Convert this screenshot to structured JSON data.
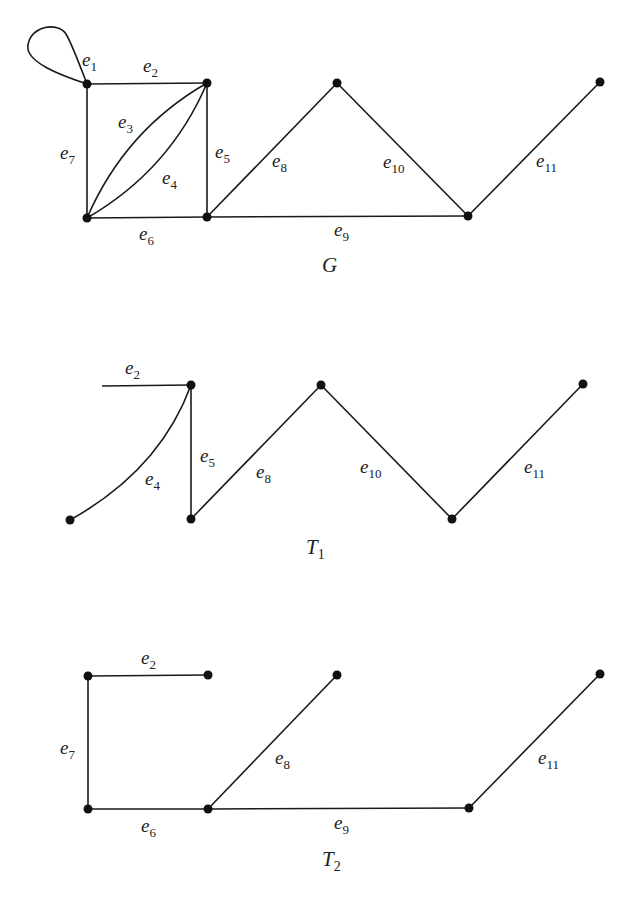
{
  "graphs": {
    "G": {
      "title": "G",
      "title_sub": "",
      "edges": {
        "e1": {
          "name": "e",
          "sub": "1"
        },
        "e2": {
          "name": "e",
          "sub": "2"
        },
        "e3": {
          "name": "e",
          "sub": "3"
        },
        "e4": {
          "name": "e",
          "sub": "4"
        },
        "e5": {
          "name": "e",
          "sub": "5"
        },
        "e6": {
          "name": "e",
          "sub": "6"
        },
        "e7": {
          "name": "e",
          "sub": "7"
        },
        "e8": {
          "name": "e",
          "sub": "8"
        },
        "e9": {
          "name": "e",
          "sub": "9"
        },
        "e10": {
          "name": "e",
          "sub": "10"
        },
        "e11": {
          "name": "e",
          "sub": "11"
        }
      },
      "vertex_count": 7,
      "edge_count": 11
    },
    "T1": {
      "title": "T",
      "title_sub": "1",
      "edges": {
        "e2": {
          "name": "e",
          "sub": "2"
        },
        "e4": {
          "name": "e",
          "sub": "4"
        },
        "e5": {
          "name": "e",
          "sub": "5"
        },
        "e8": {
          "name": "e",
          "sub": "8"
        },
        "e10": {
          "name": "e",
          "sub": "10"
        },
        "e11": {
          "name": "e",
          "sub": "11"
        }
      }
    },
    "T2": {
      "title": "T",
      "title_sub": "2",
      "edges": {
        "e2": {
          "name": "e",
          "sub": "2"
        },
        "e6": {
          "name": "e",
          "sub": "6"
        },
        "e7": {
          "name": "e",
          "sub": "7"
        },
        "e8": {
          "name": "e",
          "sub": "8"
        },
        "e9": {
          "name": "e",
          "sub": "9"
        },
        "e11": {
          "name": "e",
          "sub": "11"
        }
      }
    }
  },
  "colors": {
    "stroke": "#1a1a1a",
    "vertex": "#111111",
    "background": "#ffffff"
  }
}
